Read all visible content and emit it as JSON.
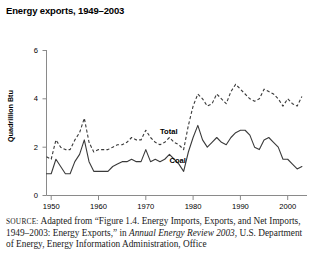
{
  "title": "Energy exports, 1949–2003",
  "source": {
    "label": "SOURCE:",
    "text_before_italic": " Adapted from “Figure 1.4. Energy Imports, Exports, and Net Imports, 1949–2003: Energy Exports,” in ",
    "italic_title": "Annual Energy Review 2003",
    "text_after_italic": ", U.S. Department of Energy, Energy Information Administration, Office"
  },
  "chart_data": {
    "type": "line",
    "title": "Energy exports, 1949–2003",
    "xlabel": "",
    "ylabel": "Quadrillion Btu",
    "xlim": [
      1949,
      2003
    ],
    "ylim": [
      0,
      6
    ],
    "yticks": [
      0,
      2,
      4,
      6
    ],
    "xticks": [
      1950,
      1960,
      1970,
      1980,
      1990,
      2000
    ],
    "grid": false,
    "legend": "inline-labels",
    "annotations": [
      {
        "text": "Total",
        "x": 1973,
        "y": 2.55
      },
      {
        "text": "Coal",
        "x": 1975,
        "y": 1.35
      }
    ],
    "x": [
      1949,
      1950,
      1951,
      1952,
      1953,
      1954,
      1955,
      1956,
      1957,
      1958,
      1959,
      1960,
      1961,
      1962,
      1963,
      1964,
      1965,
      1966,
      1967,
      1968,
      1969,
      1970,
      1971,
      1972,
      1973,
      1974,
      1975,
      1976,
      1977,
      1978,
      1979,
      1980,
      1981,
      1982,
      1983,
      1984,
      1985,
      1986,
      1987,
      1988,
      1989,
      1990,
      1991,
      1992,
      1993,
      1994,
      1995,
      1996,
      1997,
      1998,
      1999,
      2000,
      2001,
      2002,
      2003
    ],
    "series": [
      {
        "name": "Total",
        "style": "dashed",
        "values": [
          1.6,
          1.5,
          2.3,
          2.0,
          1.9,
          1.9,
          2.3,
          2.6,
          3.2,
          2.2,
          1.8,
          1.9,
          1.9,
          1.9,
          2.0,
          2.1,
          2.1,
          2.2,
          2.4,
          2.3,
          2.3,
          2.7,
          2.4,
          2.2,
          2.1,
          2.2,
          2.4,
          2.2,
          2.1,
          1.9,
          2.9,
          3.7,
          4.2,
          4.0,
          3.7,
          3.8,
          4.2,
          4.0,
          3.8,
          4.3,
          4.6,
          4.4,
          4.2,
          4.0,
          3.9,
          4.0,
          4.4,
          4.3,
          4.2,
          4.0,
          3.7,
          4.0,
          3.8,
          3.7,
          4.1
        ]
      },
      {
        "name": "Coal",
        "style": "solid",
        "values": [
          0.9,
          0.9,
          1.5,
          1.2,
          0.9,
          0.9,
          1.4,
          1.7,
          2.3,
          1.4,
          1.0,
          1.0,
          1.0,
          1.0,
          1.2,
          1.3,
          1.4,
          1.4,
          1.5,
          1.4,
          1.4,
          1.9,
          1.4,
          1.5,
          1.4,
          1.5,
          1.7,
          1.5,
          1.3,
          1.0,
          1.8,
          2.4,
          2.9,
          2.3,
          2.0,
          2.2,
          2.4,
          2.2,
          2.1,
          2.4,
          2.6,
          2.7,
          2.7,
          2.5,
          2.0,
          1.9,
          2.3,
          2.4,
          2.2,
          2.0,
          1.5,
          1.5,
          1.3,
          1.1,
          1.2
        ]
      }
    ]
  },
  "axis": {
    "y_title": "Quadrillion Btu",
    "y_ticks": [
      "0",
      "2",
      "4",
      "6"
    ],
    "x_ticks": [
      "1950",
      "1960",
      "1970",
      "1980",
      "1990",
      "2000"
    ]
  },
  "labels": {
    "total": "Total",
    "coal": "Coal"
  }
}
